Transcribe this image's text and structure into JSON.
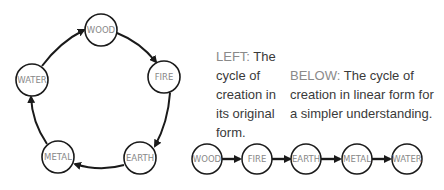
{
  "cycle_diagram": {
    "nodes": [
      {
        "label": "WOOD",
        "cx": 101,
        "cy": 30
      },
      {
        "label": "FIRE",
        "cx": 164,
        "cy": 77
      },
      {
        "label": "EARTH",
        "cx": 140,
        "cy": 158
      },
      {
        "label": "METAL",
        "cx": 58,
        "cy": 157
      },
      {
        "label": "WATER",
        "cx": 32,
        "cy": 80
      }
    ],
    "direction": "clockwise"
  },
  "captions": {
    "left": {
      "lead": "LEFT:",
      "text": " The cycle of creation in its original form."
    },
    "below": {
      "lead": "BELOW:",
      "text": " The cycle of creation in linear form for a simpler understanding."
    }
  },
  "linear_diagram": {
    "nodes": [
      "WOOD",
      "FIRE",
      "EARTH",
      "METAL",
      "WATER"
    ]
  },
  "colors": {
    "stroke": "#1a1a1a",
    "label": "#888888",
    "caption_lead": "#8a8a8a",
    "caption_text": "#3a3a3a"
  }
}
